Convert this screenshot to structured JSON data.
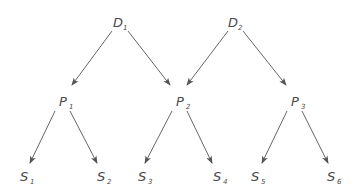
{
  "diagram": {
    "type": "directed-tree",
    "colors": {
      "line": "#555555",
      "text": "#4a4a4a",
      "background": "#ffffff"
    },
    "nodes": [
      {
        "id": "D1",
        "letter": "D",
        "sub": "1",
        "x": 113,
        "y": 27
      },
      {
        "id": "D2",
        "letter": "D",
        "sub": "2",
        "x": 228,
        "y": 27
      },
      {
        "id": "P1",
        "letter": "P",
        "sub": "1",
        "x": 59,
        "y": 106
      },
      {
        "id": "P2",
        "letter": "P",
        "sub": "2",
        "x": 176,
        "y": 106
      },
      {
        "id": "P3",
        "letter": "P",
        "sub": "3",
        "x": 291,
        "y": 106
      },
      {
        "id": "S1",
        "letter": "S",
        "sub": "1",
        "x": 20,
        "y": 181
      },
      {
        "id": "S2",
        "letter": "S",
        "sub": "2",
        "x": 97,
        "y": 181
      },
      {
        "id": "S3",
        "letter": "S",
        "sub": "3",
        "x": 138,
        "y": 181
      },
      {
        "id": "S4",
        "letter": "S",
        "sub": "4",
        "x": 213,
        "y": 181
      },
      {
        "id": "S5",
        "letter": "S",
        "sub": "5",
        "x": 251,
        "y": 181
      },
      {
        "id": "S6",
        "letter": "S",
        "sub": "6",
        "x": 327,
        "y": 181
      }
    ],
    "edges": [
      {
        "from": "D1",
        "to": "P1",
        "x1": 112,
        "y1": 31,
        "x2": 72,
        "y2": 85
      },
      {
        "from": "D1",
        "to": "P2",
        "x1": 128,
        "y1": 31,
        "x2": 170,
        "y2": 85
      },
      {
        "from": "D2",
        "to": "P2",
        "x1": 228,
        "y1": 31,
        "x2": 187,
        "y2": 85
      },
      {
        "from": "D2",
        "to": "P3",
        "x1": 243,
        "y1": 31,
        "x2": 286,
        "y2": 85
      },
      {
        "from": "P1",
        "to": "S1",
        "x1": 55,
        "y1": 111,
        "x2": 30,
        "y2": 163
      },
      {
        "from": "P1",
        "to": "S2",
        "x1": 70,
        "y1": 111,
        "x2": 97,
        "y2": 163
      },
      {
        "from": "P2",
        "to": "S3",
        "x1": 172,
        "y1": 111,
        "x2": 145,
        "y2": 163
      },
      {
        "from": "P2",
        "to": "S4",
        "x1": 187,
        "y1": 111,
        "x2": 212,
        "y2": 163
      },
      {
        "from": "P3",
        "to": "S5",
        "x1": 287,
        "y1": 111,
        "x2": 262,
        "y2": 163
      },
      {
        "from": "P3",
        "to": "S6",
        "x1": 302,
        "y1": 111,
        "x2": 328,
        "y2": 163
      }
    ]
  }
}
